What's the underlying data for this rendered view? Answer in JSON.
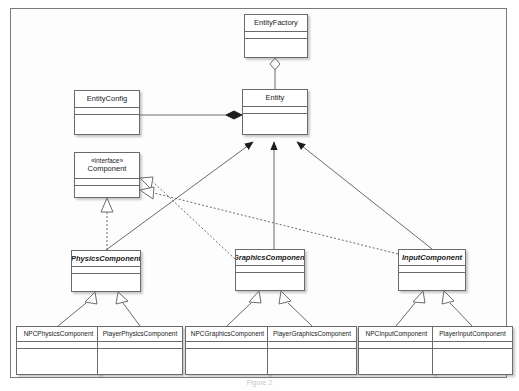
{
  "diagram": {
    "caption": "Figure 2",
    "stereotype_interface": "«interface»",
    "colors": {
      "box_border": "#6b6b6b",
      "frame_border": "#7a7a7a",
      "line": "#6b6b6b",
      "fill": "#ffffff",
      "background": "#fdfdfd",
      "caption_text": "#c9c9c9"
    },
    "classes": [
      {
        "id": "entityfactory",
        "name": "EntityFactory",
        "kind": "class",
        "x": 244,
        "y": 14,
        "w": 64,
        "h": 44
      },
      {
        "id": "entityconfig",
        "name": "EntityConfig",
        "kind": "class",
        "x": 74,
        "y": 90,
        "w": 66,
        "h": 45
      },
      {
        "id": "entity",
        "name": "Entity",
        "kind": "class",
        "x": 242,
        "y": 89,
        "w": 66,
        "h": 46
      },
      {
        "id": "component",
        "name": "Component",
        "kind": "interface",
        "x": 74,
        "y": 152,
        "w": 66,
        "h": 46
      },
      {
        "id": "physicscomponent",
        "name": "PhysicsComponent",
        "kind": "abstract",
        "x": 71,
        "y": 250,
        "w": 70,
        "h": 42
      },
      {
        "id": "graphicscomponent",
        "name": "GraphicsComponent",
        "kind": "abstract",
        "x": 235,
        "y": 249,
        "w": 70,
        "h": 42
      },
      {
        "id": "inputcomponent",
        "name": "InputComponent",
        "kind": "abstract",
        "x": 398,
        "y": 249,
        "w": 68,
        "h": 42
      },
      {
        "id": "npcphysicscomponent",
        "name": "NPCPhysicsComponent",
        "kind": "class",
        "x": 16,
        "y": 326,
        "w": 85,
        "h": 49
      },
      {
        "id": "playerphysicscomponent",
        "name": "PlayerPhysicsComponent",
        "kind": "class",
        "x": 97,
        "y": 326,
        "w": 86,
        "h": 49
      },
      {
        "id": "npcgraphicscomponent",
        "name": "NPCGraphicsComponent",
        "kind": "class",
        "x": 185,
        "y": 326,
        "w": 85,
        "h": 49
      },
      {
        "id": "playergraphicscomponent",
        "name": "PlayerGraphicsComponent",
        "kind": "class",
        "x": 267,
        "y": 326,
        "w": 90,
        "h": 49
      },
      {
        "id": "npcinputcomponent",
        "name": "NPCInputComponent",
        "kind": "class",
        "x": 358,
        "y": 326,
        "w": 77,
        "h": 49
      },
      {
        "id": "playerinputcomponent",
        "name": "PlayerInputComponent",
        "kind": "class",
        "x": 432,
        "y": 326,
        "w": 81,
        "h": 49
      }
    ],
    "relationships": [
      {
        "from": "entityfactory",
        "to": "entity",
        "type": "aggregation",
        "marker": "hollow-diamond"
      },
      {
        "from": "entityconfig",
        "to": "entity",
        "type": "composition",
        "marker": "filled-diamond"
      },
      {
        "from": "physicscomponent",
        "to": "entity",
        "type": "association",
        "marker": "filled-arrow"
      },
      {
        "from": "graphicscomponent",
        "to": "entity",
        "type": "association",
        "marker": "filled-arrow"
      },
      {
        "from": "inputcomponent",
        "to": "entity",
        "type": "association",
        "marker": "filled-arrow"
      },
      {
        "from": "physicscomponent",
        "to": "component",
        "type": "realization",
        "marker": "hollow-triangle-dashed"
      },
      {
        "from": "graphicscomponent",
        "to": "component",
        "type": "realization",
        "marker": "hollow-triangle-dashed"
      },
      {
        "from": "inputcomponent",
        "to": "component",
        "type": "realization",
        "marker": "hollow-triangle-dashed"
      },
      {
        "from": "npcphysicscomponent",
        "to": "physicscomponent",
        "type": "generalization",
        "marker": "hollow-triangle"
      },
      {
        "from": "playerphysicscomponent",
        "to": "physicscomponent",
        "type": "generalization",
        "marker": "hollow-triangle"
      },
      {
        "from": "npcgraphicscomponent",
        "to": "graphicscomponent",
        "type": "generalization",
        "marker": "hollow-triangle"
      },
      {
        "from": "playergraphicscomponent",
        "to": "graphicscomponent",
        "type": "generalization",
        "marker": "hollow-triangle"
      },
      {
        "from": "npcinputcomponent",
        "to": "inputcomponent",
        "type": "generalization",
        "marker": "hollow-triangle"
      },
      {
        "from": "playerinputcomponent",
        "to": "inputcomponent",
        "type": "generalization",
        "marker": "hollow-triangle"
      }
    ]
  }
}
